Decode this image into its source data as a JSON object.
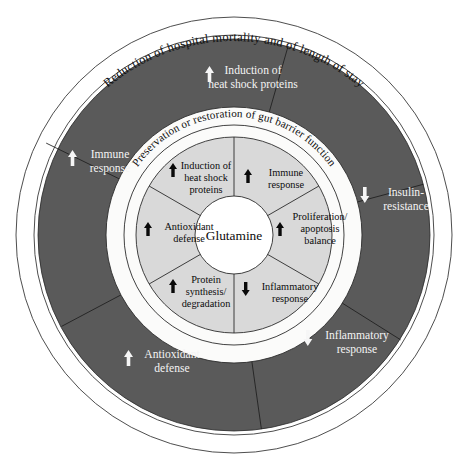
{
  "figure": {
    "name": "glutamine-effects-concentric-wheel",
    "type": "concentric-ring-diagram",
    "center_label": "Glutamine",
    "colors": {
      "page_background": "#ffffff",
      "outer_ring_band": "#ffffff",
      "dark_ring_band": "#5a5a5a",
      "middle_ring_band": "#fbfbfa",
      "inner_ring_band": "#d9d9d9",
      "core_disc": "#ffffff",
      "dark_ring_text": "#f4f4f4",
      "light_text": "#0c0c0c",
      "outline": "#2d2d2d"
    }
  },
  "rings": {
    "outer": {
      "name": "outcome-ring",
      "curved_label": "Reduction of hospital mortality and of length of stay"
    },
    "dark": {
      "name": "systemic-effects-ring",
      "segments": [
        {
          "label_line1": "Induction of",
          "label_line2": "heat shock proteins",
          "arrow": "up",
          "arrow_color": "#f6f6f6"
        },
        {
          "label_line1": "Insulin-",
          "label_line2": "resistance",
          "arrow": "down",
          "arrow_color": "#f6f6f6"
        },
        {
          "label_line1": "Inflammatory",
          "label_line2": "response",
          "arrow": "down",
          "arrow_color": "#f6f6f6"
        },
        {
          "label_line1": "Antioxidant",
          "label_line2": "defense",
          "arrow": "up",
          "arrow_color": "#f6f6f6"
        },
        {
          "label_line1": "Immune",
          "label_line2": "response",
          "arrow": "up",
          "arrow_color": "#f6f6f6"
        }
      ]
    },
    "middle": {
      "name": "gut-barrier-ring",
      "curved_label": "Preservation or restoration of gut barrier function"
    },
    "inner": {
      "name": "cellular-mechanisms-ring",
      "segments": [
        {
          "label_line1": "Induction of",
          "label_line2": "heat shock",
          "label_line3": "proteins",
          "arrow": "up",
          "arrow_color": "#0a0a0a"
        },
        {
          "label_line1": "Immune",
          "label_line2": "response",
          "label_line3": "",
          "arrow": "up",
          "arrow_color": "#0a0a0a"
        },
        {
          "label_line1": "Proliferation/",
          "label_line2": "apoptosis",
          "label_line3": "balance",
          "arrow": "up",
          "arrow_color": "#0a0a0a"
        },
        {
          "label_line1": "Inflammatory",
          "label_line2": "response",
          "label_line3": "",
          "arrow": "down",
          "arrow_color": "#0a0a0a"
        },
        {
          "label_line1": "Protein",
          "label_line2": "synthesis/",
          "label_line3": "degradation",
          "arrow": "up",
          "arrow_color": "#0a0a0a"
        },
        {
          "label_line1": "Antioxidant",
          "label_line2": "defense",
          "label_line3": "",
          "arrow": "up",
          "arrow_color": "#0a0a0a"
        }
      ]
    }
  }
}
